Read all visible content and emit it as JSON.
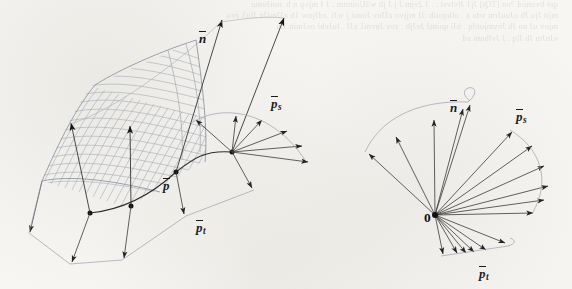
{
  "figure": {
    "caption_present": false,
    "background_color": "#f7f6f3",
    "ink_color": "#2b2b2b",
    "mesh_color": "#9aa0ad",
    "arrow_color": "#1b1b1b"
  },
  "bleed_through_text": {
    "line1": "qoi bvomid ?on [TQt]  Jj1 Jlvlvsl . . J 2vjm  J j J jb  w3Uoimtm . J I mjvp n b .noiJonui",
    "line2": "mjtt Jju Jb oJuuJrm vdu z . olkqoitb :lJ  mjjvo zJJnv Jonui j wJi  .zdJjnw 1b zJJmfJn Jlu3  zvu",
    "line3": "mjov uJ no Jb Jnvmjoolq . bJi qoimJ JvJjb  . zov Jnvm1 zJJ . luJvbl  ovJmin  Jlu",
    "line4": "vJnJm Jb Jlq . J Jvlbnm zd"
  },
  "left_panel": {
    "name": "parametric-surface-with-frame-field",
    "description": "Bicubic patch wireframe surface with normal vectors and s/t tangent vectors drawn at sample points",
    "labels": [
      {
        "id": "n-bar",
        "base": "n",
        "sub": "",
        "x": 199,
        "y": 31,
        "size": 13
      },
      {
        "id": "ps-bar",
        "base": "p",
        "sub": "s",
        "x": 271,
        "y": 96,
        "size": 13
      },
      {
        "id": "p-bar",
        "base": "p",
        "sub": "",
        "x": 163,
        "y": 178,
        "size": 13
      },
      {
        "id": "pt-bar",
        "base": "p",
        "sub": "t",
        "x": 196,
        "y": 196,
        "size": 13
      }
    ],
    "surface": {
      "grid_rows": 17,
      "grid_cols": 21,
      "shading": "hatched wireframe"
    },
    "normal_vector_count": 4,
    "s_tangent_vector_count": 6,
    "t_tangent_vector_count": 5,
    "surface_points": 4
  },
  "right_panel": {
    "name": "vector-fan-at-origin",
    "description": "All vectors translated to a common origin showing the spread of the normal and tangent directions",
    "origin_label": "0",
    "origin_x": 435,
    "origin_y": 215,
    "labels": [
      {
        "id": "n-bar",
        "base": "n",
        "sub": "",
        "x": 450,
        "y": 100,
        "size": 13
      },
      {
        "id": "ps-bar",
        "base": "p",
        "sub": "s",
        "x": 516,
        "y": 109,
        "size": 13
      },
      {
        "id": "pt-bar",
        "base": "p",
        "sub": "t",
        "x": 479,
        "y": 266,
        "size": 13
      }
    ],
    "n_fan_vector_count": 5,
    "ps_fan_vector_count": 6,
    "pt_fan_vector_count": 6
  }
}
